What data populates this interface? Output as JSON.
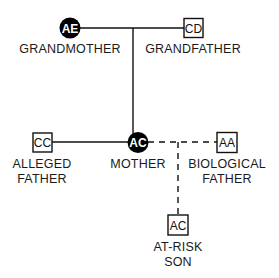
{
  "diagram": {
    "type": "pedigree-chart",
    "nodes": [
      {
        "id": "AE",
        "shape": "circle",
        "filled": true,
        "label_lines": [
          "GRANDMOTHER"
        ]
      },
      {
        "id": "CD",
        "shape": "square",
        "filled": false,
        "label_lines": [
          "GRANDFATHER"
        ]
      },
      {
        "id": "AC",
        "shape": "circle",
        "filled": true,
        "label_lines": [
          "MOTHER"
        ]
      },
      {
        "id": "CC",
        "shape": "square",
        "filled": false,
        "label_lines": [
          "ALLEGED",
          "FATHER"
        ]
      },
      {
        "id": "AA",
        "shape": "square",
        "filled": false,
        "label_lines": [
          "BIOLOGICAL",
          "FATHER"
        ]
      },
      {
        "id": "AC",
        "shape": "square",
        "filled": false,
        "label_lines": [
          "AT-RISK",
          "SON"
        ]
      }
    ],
    "edges": [
      {
        "from": "GRANDMOTHER",
        "to": "GRANDFATHER",
        "style": "solid",
        "kind": "mating"
      },
      {
        "from": "GRANDPARENTS",
        "to": "MOTHER",
        "style": "solid",
        "kind": "descent"
      },
      {
        "from": "ALLEGED FATHER",
        "to": "MOTHER",
        "style": "solid",
        "kind": "mating"
      },
      {
        "from": "MOTHER",
        "to": "BIOLOGICAL FATHER",
        "style": "dashed",
        "kind": "mating"
      },
      {
        "from": "MOTHER+BIOLOGICAL FATHER",
        "to": "AT-RISK SON",
        "style": "dashed",
        "kind": "descent"
      }
    ]
  },
  "colors": {
    "line": "#111111",
    "fill": "#000000",
    "background": "#ffffff"
  }
}
